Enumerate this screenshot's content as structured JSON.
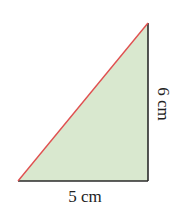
{
  "diagram": {
    "shape": "right-triangle",
    "fill_color": "#d9e8cf",
    "hypotenuse_color": "#e05050",
    "leg_color": "#2a2a2a",
    "vertices": {
      "bottom_left": [
        18,
        181
      ],
      "bottom_right": [
        148,
        181
      ],
      "top_right": [
        148,
        23
      ]
    },
    "labels": {
      "base": "5 cm",
      "height": "6 cm"
    }
  }
}
